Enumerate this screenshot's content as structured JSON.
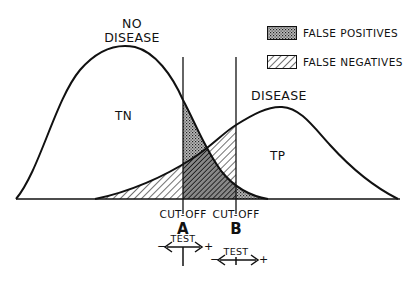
{
  "labels": {
    "no_disease_line1": "NO",
    "no_disease_line2": "DISEASE",
    "disease": "DISEASE",
    "tn": "TN",
    "tp": "TP",
    "cutoff_a": "CUT-OFF",
    "cutoff_a_letter": "A",
    "cutoff_b": "CUT-OFF",
    "cutoff_b_letter": "B",
    "test_a": "TEST",
    "test_b": "TEST",
    "minus": "−",
    "plus": "+"
  },
  "legend": [
    {
      "label": "FALSE POSITIVES",
      "pattern": "crosshatch-stipple"
    },
    {
      "label": "FALSE NEGATIVES",
      "pattern": "diagonal-hatch"
    }
  ],
  "colors": {
    "line": "#111111",
    "background": "#ffffff"
  }
}
